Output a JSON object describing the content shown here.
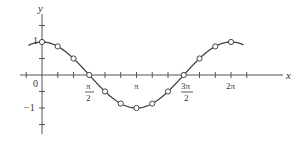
{
  "chart_data": {
    "type": "line",
    "title": "",
    "function": "y = cos x",
    "xlabel": "x",
    "ylabel": "y",
    "xlim": [
      -0.9,
      5.9
    ],
    "ylim": [
      -1.6,
      2.0
    ],
    "grid": false,
    "legend": null,
    "x_tick_labels": [
      {
        "value": 0,
        "label": "0"
      },
      {
        "value": 1.5708,
        "label": "π/2"
      },
      {
        "value": 3.1416,
        "label": "π"
      },
      {
        "value": 4.7124,
        "label": "3π/2"
      },
      {
        "value": 6.2832,
        "label": "2π"
      }
    ],
    "x_tick_step": 0.5236,
    "y_tick_labels": [
      {
        "value": 1,
        "label": "1"
      },
      {
        "value": -1,
        "label": "−1"
      }
    ],
    "y_tick_step": 0.5,
    "curve_range": [
      -0.45,
      6.7
    ],
    "points": {
      "x_labels": [
        "0",
        "π/6",
        "π/3",
        "π/2",
        "2π/3",
        "5π/6",
        "π",
        "7π/6",
        "4π/3",
        "3π/2",
        "5π/3",
        "11π/6",
        "2π"
      ],
      "x": [
        0,
        0.5236,
        1.0472,
        1.5708,
        2.0944,
        2.618,
        3.1416,
        3.6652,
        4.1888,
        4.7124,
        5.236,
        5.7596,
        6.2832
      ],
      "y": [
        1,
        0.866,
        0.5,
        0,
        -0.5,
        -0.866,
        -1,
        -0.866,
        -0.5,
        0,
        0.5,
        0.866,
        1
      ],
      "marker": "open-circle"
    }
  },
  "labels": {
    "x_axis": "x",
    "y_axis": "y",
    "origin": "0",
    "y_one": "1",
    "y_neg_one": "−1",
    "pi": "π",
    "pi_half_num": "π",
    "pi_half_den": "2",
    "three_pi_half_num": "3π",
    "three_pi_half_den": "2",
    "two_pi": "2π"
  },
  "colors": {
    "axis": "#555555",
    "curve": "#444444",
    "marker_fill": "#ffffff"
  }
}
